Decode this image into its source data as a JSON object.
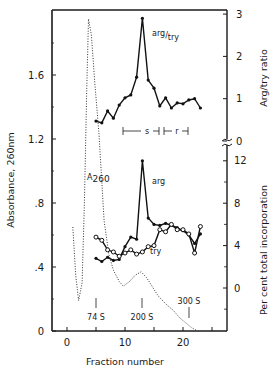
{
  "chart_data": {
    "type": "line",
    "title": "",
    "xlabel": "Fraction number",
    "ylabel_left": "Absorbance, 260nm",
    "ylabel_right_upper": "Arg/try ratio",
    "ylabel_right_lower": "Per cent total incorporation",
    "x_ticks": [
      0,
      10,
      20
    ],
    "xlim": [
      -2,
      27
    ],
    "left_axis": {
      "ticks": [
        "0",
        ".4",
        ".8",
        "1.2",
        "1.6"
      ],
      "ylim": [
        0,
        2.0
      ]
    },
    "right_upper_axis": {
      "ticks": [
        "0",
        "1",
        "2",
        "3"
      ],
      "ylim": [
        0,
        3
      ]
    },
    "right_lower_axis": {
      "ticks": [
        "0",
        "4",
        "8",
        "12"
      ],
      "ylim": [
        -4,
        12
      ]
    },
    "grid": false,
    "series": [
      {
        "name": "A260",
        "label": "A260",
        "style": "dotted",
        "axis": "left",
        "x": [
          1.0,
          1.5,
          2.0,
          2.6,
          3.0,
          3.4,
          3.7,
          4.2,
          4.8,
          5.5,
          6.4,
          7.2,
          8.0,
          9.0,
          9.7,
          10.8,
          11.8,
          12.8,
          13.8,
          15.0,
          15.7,
          17.0,
          18.3,
          19.5,
          20.5,
          21.5,
          22.5
        ],
        "values": [
          0.65,
          0.35,
          0.19,
          0.3,
          0.8,
          1.5,
          1.95,
          1.85,
          1.55,
          1.24,
          0.69,
          0.48,
          0.38,
          0.31,
          0.28,
          0.31,
          0.35,
          0.37,
          0.33,
          0.26,
          0.22,
          0.17,
          0.13,
          0.08,
          0.05,
          0.02,
          0.0
        ]
      },
      {
        "name": "arg/try",
        "label": "arg/try",
        "style": "solid-filled-markers",
        "axis": "right_upper",
        "x": [
          5,
          6,
          7,
          8,
          9,
          10,
          11,
          12,
          13,
          14,
          15,
          16,
          17,
          18,
          19,
          20,
          21,
          22,
          23
        ],
        "values": [
          0.47,
          0.43,
          0.71,
          0.54,
          0.85,
          1.02,
          1.09,
          1.51,
          2.9,
          1.44,
          1.25,
          0.83,
          1.02,
          0.78,
          0.9,
          0.88,
          0.97,
          1.0,
          0.78
        ]
      },
      {
        "name": "arg",
        "label": "arg",
        "style": "solid-filled-markers",
        "axis": "right_lower",
        "x": [
          5,
          6,
          7,
          8,
          9,
          10,
          11,
          12,
          13,
          14,
          15,
          16,
          17,
          18,
          19,
          20,
          21,
          22,
          23
        ],
        "values": [
          2.8,
          2.5,
          2.9,
          2.6,
          2.7,
          3.9,
          4.8,
          4.6,
          12.0,
          6.6,
          6.0,
          5.9,
          6.1,
          5.9,
          5.7,
          5.4,
          5.0,
          4.2,
          5.1
        ]
      },
      {
        "name": "try",
        "label": "try",
        "style": "solid-open-markers",
        "axis": "right_lower",
        "x": [
          5,
          6,
          7,
          8,
          9,
          10,
          11,
          12,
          13,
          14,
          15,
          16,
          17,
          18,
          19,
          20,
          21,
          22,
          23
        ],
        "values": [
          4.8,
          4.5,
          3.6,
          3.4,
          3.0,
          3.3,
          3.6,
          3.2,
          3.4,
          3.9,
          4.0,
          5.5,
          5.3,
          6.0,
          5.5,
          5.5,
          5.1,
          3.3,
          5.8
        ]
      }
    ],
    "annotations": [
      {
        "text": "74 S",
        "x": 5
      },
      {
        "text": "200 S",
        "x": 13
      },
      {
        "text": "300 S",
        "x": 21
      },
      {
        "text": "s",
        "type": "range",
        "from": 10,
        "to": 16
      },
      {
        "text": "r",
        "type": "range",
        "from": 16,
        "to": 21
      }
    ]
  },
  "labels": {
    "xlabel": "Fraction number",
    "ylabel_left": "Absorbance, 260nm",
    "ylabel_right_upper": "Arg/try ratio",
    "ylabel_right_lower": "Per cent total incorporation",
    "a260": "A",
    "a260_sub": "260",
    "arg_try_num": "arg",
    "arg_try_den": "try",
    "arg": "arg",
    "try": "try",
    "s74": "74 S",
    "s200": "200 S",
    "s300": "300 S",
    "range_s": "s",
    "range_r": "r"
  }
}
